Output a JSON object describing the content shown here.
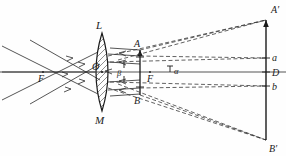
{
  "figure": {
    "type": "optics-ray-diagram",
    "background_color": "#fefefe",
    "ink_color": "#1a1a1a",
    "axis_color": "#555555"
  },
  "labels": {
    "lens_top": "L",
    "lens_bottom": "M",
    "lens_center": "O",
    "focus_left": "F",
    "focus_right": "F",
    "object_top": "A",
    "object_bottom": "B",
    "image_top": "A′",
    "image_bottom": "B′",
    "screen_upper": "a",
    "screen_center": "D",
    "screen_lower": "b",
    "angle_alpha": "α",
    "angle_beta": "β"
  },
  "geometry": {
    "optical_axis": {
      "x1": 0,
      "y1": 72,
      "x2": 286,
      "y2": 72
    },
    "lens": {
      "cx": 102,
      "cy": 72,
      "half_height": 39,
      "half_width": 10
    },
    "object_arrow": {
      "x": 140,
      "y_top": 50,
      "y_bottom": 95
    },
    "image_arrow": {
      "x": 266,
      "y_top": 20,
      "y_bottom": 140
    },
    "focus_left_point": {
      "x": 43,
      "y": 72
    },
    "focus_right_point": {
      "x": 150,
      "y": 72
    },
    "screen_marks": [
      {
        "label": "a",
        "x": 266,
        "y": 58
      },
      {
        "label": "D",
        "x": 266,
        "y": 72
      },
      {
        "label": "b",
        "x": 266,
        "y": 86
      }
    ]
  },
  "rays": {
    "incoming_count": 3,
    "style_incoming": "solid with arrowheads",
    "style_projected": "dashed",
    "description": "Three solid converging rays pass through left focus F into lens L-M; dashed construction rays extend from lens and object tips to image points A′ and B′ on the right screen."
  }
}
